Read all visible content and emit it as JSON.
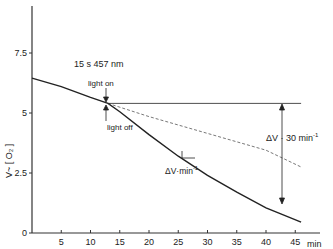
{
  "chart_data": {
    "type": "line",
    "title": "",
    "xlabel": "min",
    "ylabel": "V~ [O2]",
    "xlim": [
      0,
      48
    ],
    "ylim": [
      0,
      8.9
    ],
    "x_ticks": [
      5,
      10,
      15,
      20,
      25,
      30,
      35,
      40,
      45
    ],
    "x_tick_labels": [
      "5",
      "10",
      "15",
      "20",
      "25",
      "30",
      "35",
      "40",
      "45"
    ],
    "y_ticks": [
      0,
      2.5,
      5,
      7.5
    ],
    "y_tick_labels": [
      "0",
      "2.5",
      "5",
      "7.5"
    ],
    "grid": false,
    "legend": null,
    "series": [
      {
        "name": "measured trace",
        "style": "solid",
        "x": [
          0,
          5,
          10,
          13,
          15,
          20,
          25,
          30,
          35,
          40,
          42,
          46
        ],
        "y": [
          6.45,
          6.1,
          5.65,
          5.4,
          5.05,
          4.1,
          3.2,
          2.4,
          1.7,
          1.05,
          0.85,
          0.45
        ]
      },
      {
        "name": "extrapolated dark rate",
        "style": "dashed",
        "x": [
          13,
          20,
          30,
          40,
          46
        ],
        "y": [
          5.4,
          4.85,
          4.15,
          3.45,
          2.75
        ]
      },
      {
        "name": "reference level",
        "style": "solid-thin",
        "x": [
          13,
          46
        ],
        "y": [
          5.4,
          5.4
        ]
      }
    ],
    "annotations": [
      {
        "text": "15 s 457 nm",
        "x": 13,
        "y": 6.9
      },
      {
        "text": "light on",
        "x": 13,
        "y": 6.2,
        "arrow": "down"
      },
      {
        "text": "light off",
        "x": 13,
        "y": 4.5,
        "arrow": "up"
      },
      {
        "text": "ΔV·min⁻¹",
        "x": 25,
        "y": 2.6,
        "note": "slope triangle on curve"
      },
      {
        "text": "ΔV · 30 min⁻¹",
        "x": 43,
        "y": 3.6,
        "note": "double arrow between reference line and curve at ~43 min"
      }
    ]
  },
  "labels": {
    "y_axis": "V~   [ O₂ ]",
    "x_unit": "min",
    "wavelength": "15 s 457 nm",
    "light_on": "light on",
    "light_off": "light off",
    "slope_label": "ΔV·min",
    "slope_exp": "-1",
    "delta_label": "ΔV · 30 min",
    "delta_exp": "-1"
  }
}
